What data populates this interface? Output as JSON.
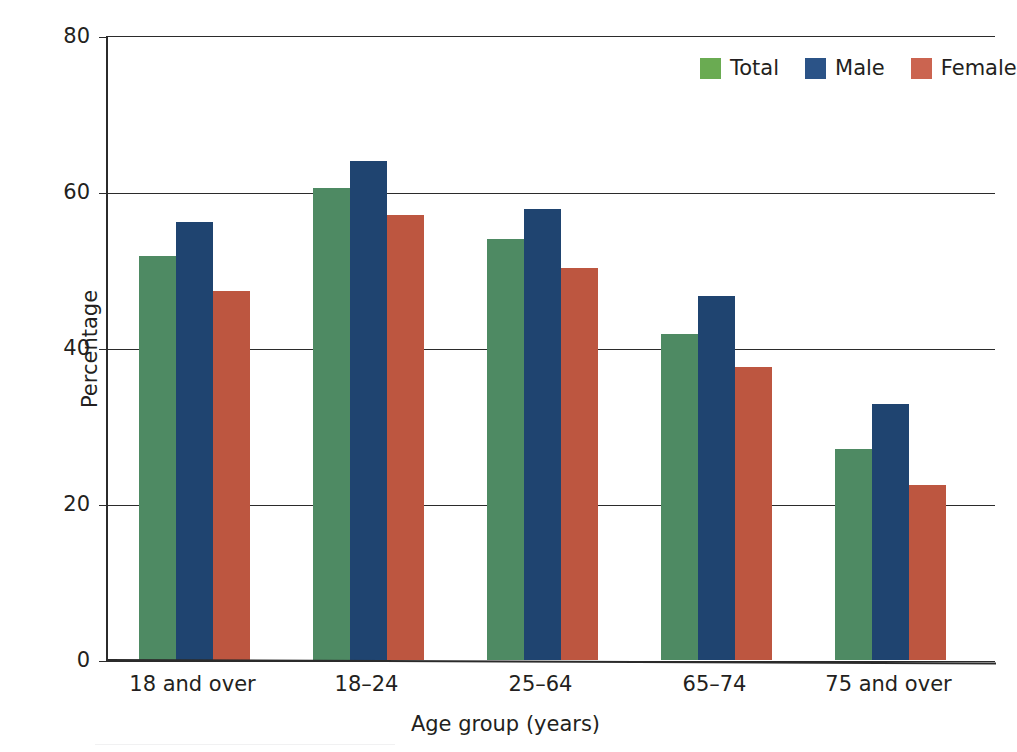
{
  "chart_data": {
    "type": "bar",
    "title": "",
    "subtitle": "",
    "xlabel": "Age group (years)",
    "ylabel": "Percentage",
    "categories": [
      "18 and over",
      "18–24",
      "25–64",
      "65–74",
      "75 and over"
    ],
    "series": [
      {
        "name": "Total",
        "color": "#4e8a63",
        "legend_color": "#6aab52",
        "values": [
          51.8,
          60.5,
          54.0,
          41.8,
          27.0
        ]
      },
      {
        "name": "Male",
        "color": "#1f4470",
        "legend_color": "#2b5387",
        "values": [
          56.2,
          64.0,
          57.8,
          46.7,
          32.8
        ]
      },
      {
        "name": "Female",
        "color": "#bd5640",
        "legend_color": "#cb6450",
        "values": [
          47.3,
          57.0,
          50.2,
          37.6,
          22.5
        ]
      }
    ],
    "ylim": [
      0,
      80
    ],
    "yticks": [
      0,
      20,
      40,
      60,
      80
    ],
    "ytick_labels": [
      "0",
      "20",
      "40",
      "60",
      "80"
    ],
    "grid": true,
    "grid_axis": "y",
    "legend_position": "top-right"
  },
  "axes": {
    "y_title": "Percentage",
    "x_title": "Age group (years)"
  },
  "legend": {
    "entries": [
      {
        "label": "Total"
      },
      {
        "label": "Male"
      },
      {
        "label": "Female"
      }
    ]
  }
}
